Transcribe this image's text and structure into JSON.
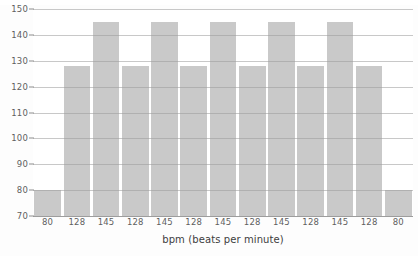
{
  "chart_data": {
    "type": "bar",
    "title": "",
    "xlabel": "bpm (beats per minute)",
    "ylabel": "",
    "categories": [
      "80",
      "128",
      "145",
      "128",
      "145",
      "128",
      "145",
      "128",
      "145",
      "128",
      "145",
      "128",
      "80"
    ],
    "values": [
      80,
      128,
      145,
      128,
      145,
      128,
      145,
      128,
      145,
      128,
      145,
      128,
      80
    ],
    "ylim": [
      70,
      150
    ],
    "yticks": [
      70,
      80,
      90,
      100,
      110,
      120,
      130,
      140,
      150
    ],
    "ytick_labels": [
      "70",
      "80",
      "90",
      "100",
      "110",
      "120",
      "130",
      "140",
      "150"
    ],
    "grid": true,
    "legend": "none",
    "bar_color": "#c9c9c9",
    "grid_color": "#9a9a9a",
    "axis_text_color": "#5f5f5f",
    "background_color": "#ffffff"
  }
}
